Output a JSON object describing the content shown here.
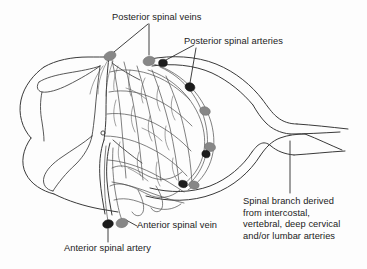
{
  "figure": {
    "background_color": "#fdfdfd",
    "line_color": "#3a3a3a",
    "text_color": "#222222"
  },
  "labels": {
    "posterior_spinal_veins": "Posterior spinal veins",
    "posterior_spinal_arteries": "Posterior spinal arteries",
    "anterior_spinal_vein": "Anterior spinal vein",
    "anterior_spinal_artery": "Anterior spinal artery",
    "spinal_branch": "Spinal branch derived\nfrom intercostal,\nvertebral, deep cervical\nand/or lumbar arteries"
  },
  "vessel_markers": {
    "vein_color": "#878787",
    "artery_color": "#1c1c1c",
    "veins": [
      {
        "name": "posterior-spinal-vein-left",
        "cx": 110,
        "cy": 56,
        "rx": 6.2,
        "ry": 4.4,
        "angle": -22
      },
      {
        "name": "posterior-spinal-vein-right",
        "cx": 149,
        "cy": 61,
        "rx": 6.0,
        "ry": 4.6,
        "angle": -14
      },
      {
        "name": "lateral-vein-upper",
        "cx": 205,
        "cy": 111,
        "rx": 5.4,
        "ry": 4.2,
        "angle": 18
      },
      {
        "name": "lateral-vein-lower",
        "cx": 210,
        "cy": 147,
        "rx": 5.6,
        "ry": 4.4,
        "angle": 14
      },
      {
        "name": "lateral-vein-bottom",
        "cx": 194,
        "cy": 185,
        "rx": 5.2,
        "ry": 4.0,
        "angle": 10
      },
      {
        "name": "anterior-spinal-vein",
        "cx": 122,
        "cy": 223,
        "rx": 6.0,
        "ry": 4.6,
        "angle": -12
      }
    ],
    "arteries": [
      {
        "name": "posterior-spinal-artery-medial",
        "cx": 163,
        "cy": 63,
        "rx": 4.4,
        "ry": 3.8,
        "angle": 0
      },
      {
        "name": "posterior-spinal-artery-lateral",
        "cx": 190,
        "cy": 87,
        "rx": 5.0,
        "ry": 4.2,
        "angle": 22
      },
      {
        "name": "artery-mid",
        "cx": 206,
        "cy": 154,
        "rx": 4.2,
        "ry": 3.6,
        "angle": 20
      },
      {
        "name": "artery-lower",
        "cx": 183,
        "cy": 184,
        "rx": 4.4,
        "ry": 3.6,
        "angle": 12
      },
      {
        "name": "anterior-spinal-artery",
        "cx": 108,
        "cy": 224,
        "rx": 5.4,
        "ry": 4.2,
        "angle": -14
      }
    ]
  },
  "anatomy": {
    "central_canal": {
      "cx": 103,
      "cy": 133,
      "r": 2.1
    },
    "regions": [
      "spinal-cord-cross-section",
      "gray-matter-butterfly",
      "dural-sac",
      "vascular-plexus",
      "spinal-branch-vessels"
    ]
  }
}
